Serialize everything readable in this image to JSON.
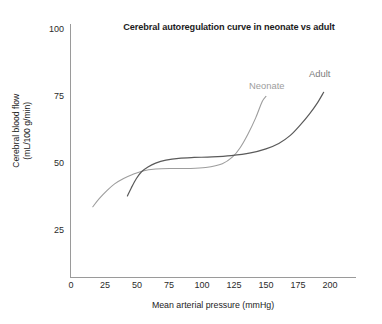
{
  "chart_data": {
    "type": "line",
    "title": "Cerebral autoregulation curve in neonate vs adult",
    "xlabel": "Mean arterial pressure (mmHg)",
    "ylabel_line1": "Cerebral blood flow",
    "ylabel_line2": "(mL/100 g/min)",
    "xlim": [
      0,
      210
    ],
    "ylim": [
      8,
      103
    ],
    "grid": false,
    "legend_position": "inline-curve-labels",
    "xticks": [
      0,
      25,
      50,
      75,
      100,
      125,
      150,
      175,
      200
    ],
    "xtick_labels": [
      "0",
      "25",
      "50",
      "75",
      "100",
      "125",
      "150",
      "175",
      "200"
    ],
    "yticks": [
      25,
      50,
      75,
      100
    ],
    "ytick_labels": [
      "25",
      "50",
      "75",
      "100"
    ],
    "series": [
      {
        "name": "Neonate",
        "color": "#9d9d9d",
        "x": [
          17,
          22,
          28,
          34,
          41,
          48,
          56,
          66,
          78,
          92,
          105,
          118,
          126,
          132,
          138,
          144,
          149,
          152
        ],
        "y": [
          34,
          37,
          40,
          42.5,
          44.5,
          46,
          47.3,
          48,
          48.2,
          48.2,
          48.6,
          50,
          52.5,
          56,
          61,
          67,
          73,
          75
        ]
      },
      {
        "name": "Adult",
        "color": "#5a5a5a",
        "x": [
          44,
          47,
          51,
          55,
          60,
          66,
          74,
          84,
          96,
          110,
          125,
          140,
          152,
          162,
          171,
          179,
          186,
          192,
          197
        ],
        "y": [
          38,
          41,
          44.5,
          47,
          48.8,
          50.2,
          51.3,
          52,
          52.3,
          52.5,
          53,
          54,
          55.5,
          57.5,
          60.5,
          64.5,
          68.5,
          72.5,
          76.5
        ]
      }
    ],
    "annotations": [
      {
        "text": "Neonate",
        "color": "#9d9d9d"
      },
      {
        "text": "Adult",
        "color": "#7c7c7c"
      }
    ]
  },
  "axes": {
    "y_label_line1": "Cerebral blood flow",
    "y_label_line2": "(mL/100 g/min)",
    "x_label": "Mean arterial pressure (mmHg)",
    "y_ticks": [
      "100",
      "75",
      "50",
      "25"
    ],
    "x_ticks": [
      "0",
      "25",
      "50",
      "75",
      "100",
      "125",
      "150",
      "175",
      "200"
    ]
  },
  "labels": {
    "neonate": "Neonate",
    "adult": "Adult"
  },
  "title": "Cerebral autoregulation curve in neonate vs adult"
}
